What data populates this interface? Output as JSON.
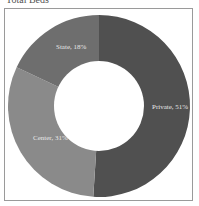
{
  "title": "Total Beds",
  "chart_data": {
    "type": "pie",
    "variant": "donut",
    "title": "Total Beds",
    "categories": [
      "Private",
      "Center",
      "State"
    ],
    "values": [
      51,
      31,
      18
    ],
    "labels": [
      "Private, 51%",
      "Center, 31%",
      "State, 18%"
    ],
    "colors": [
      "#505050",
      "#8a8a8a",
      "#6e6e6e"
    ],
    "legend": "none"
  }
}
